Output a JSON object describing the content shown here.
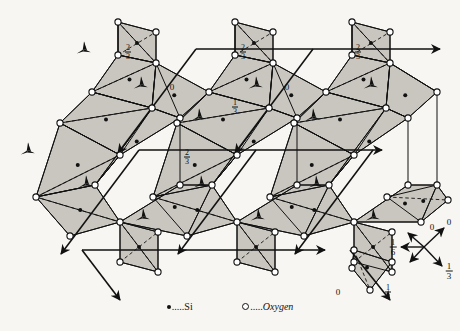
{
  "figure": {
    "background": "#f7f6f2",
    "tetra_fill": "#c9c6bf",
    "line_color": "#111111"
  },
  "legend": {
    "si_symbol": "si-dot",
    "si_leader": ".....",
    "si_label": "Si",
    "oxygen_symbol": "oxygen-circle",
    "oxygen_leader": ".....",
    "oxygen_label": "Oxygen"
  },
  "axis_key": {
    "up_right_label": "0",
    "left_label": "1/6",
    "left_num": "1",
    "left_den": "6",
    "down_right_label": "1/3",
    "down_right_num": "1",
    "down_right_den": "3"
  },
  "height_labels": [
    {
      "id": "h1",
      "text": "2/3",
      "num": "2",
      "den": "3",
      "x": 128,
      "y": 52
    },
    {
      "id": "h2",
      "text": "2/3",
      "num": "2",
      "den": "3",
      "x": 243,
      "y": 52
    },
    {
      "id": "h3",
      "text": "2/3",
      "num": "2",
      "den": "3",
      "x": 358,
      "y": 52
    },
    {
      "id": "h4",
      "text": "0",
      "num": "",
      "den": "",
      "x": 172,
      "y": 87
    },
    {
      "id": "h5",
      "text": "0",
      "num": "",
      "den": "",
      "x": 287,
      "y": 87
    },
    {
      "id": "h6",
      "text": "1/3",
      "num": "1",
      "den": "3",
      "x": 235,
      "y": 107
    },
    {
      "id": "h7",
      "text": "2/3",
      "num": "2",
      "den": "3",
      "x": 187,
      "y": 157
    },
    {
      "id": "h8",
      "text": "0",
      "num": "",
      "den": "",
      "x": 432,
      "y": 227
    },
    {
      "id": "h9",
      "text": "0",
      "num": "",
      "den": "",
      "x": 338,
      "y": 292
    },
    {
      "id": "h10",
      "text": "1/3",
      "num": "1",
      "den": "3",
      "x": 388,
      "y": 292
    }
  ],
  "triads": [
    {
      "x": 84,
      "y": 49,
      "rot": 0
    },
    {
      "x": 141,
      "y": 84,
      "rot": 0
    },
    {
      "x": 199,
      "y": 116,
      "rot": 0
    },
    {
      "x": 256,
      "y": 84,
      "rot": 0
    },
    {
      "x": 313,
      "y": 116,
      "rot": 0
    },
    {
      "x": 371,
      "y": 84,
      "rot": 0
    },
    {
      "x": 28,
      "y": 150,
      "rot": 0
    },
    {
      "x": 86,
      "y": 183,
      "rot": 0
    },
    {
      "x": 143,
      "y": 216,
      "rot": 0
    },
    {
      "x": 201,
      "y": 183,
      "rot": 0
    },
    {
      "x": 258,
      "y": 216,
      "rot": 0
    },
    {
      "x": 316,
      "y": 183,
      "rot": 0
    },
    {
      "x": 373,
      "y": 216,
      "rot": 0
    }
  ],
  "axis_arrows": [
    {
      "id": "a1",
      "x1": 196,
      "y1": 49,
      "x2": 440,
      "y2": 49
    },
    {
      "id": "a2",
      "x1": 139,
      "y1": 150,
      "x2": 382,
      "y2": 150
    },
    {
      "id": "a3",
      "x1": 82,
      "y1": 250,
      "x2": 325,
      "y2": 250
    }
  ],
  "diagonal_arrows": [
    {
      "id": "d1",
      "x1": 196,
      "y1": 49,
      "x2": 118,
      "y2": 153
    },
    {
      "id": "d2",
      "x1": 313,
      "y1": 49,
      "x2": 235,
      "y2": 153
    },
    {
      "id": "d3",
      "x1": 139,
      "y1": 150,
      "x2": 61,
      "y2": 254
    },
    {
      "id": "d4",
      "x1": 256,
      "y1": 150,
      "x2": 178,
      "y2": 254
    },
    {
      "id": "d5",
      "x1": 373,
      "y1": 150,
      "x2": 295,
      "y2": 254
    },
    {
      "id": "d6",
      "x1": 82,
      "y1": 250,
      "x2": 120,
      "y2": 300
    },
    {
      "id": "d7",
      "x1": 350,
      "y1": 250,
      "x2": 390,
      "y2": 300
    }
  ],
  "atoms": {
    "si_label": "Si",
    "oxygen_label": "Oxygen",
    "si_count": 18,
    "oxygen_count": 44
  },
  "chart_data": {
    "type": "diagram",
    "symbols": [
      "Si",
      "Oxygen"
    ],
    "heights": [
      "0",
      "1/6",
      "1/3",
      "2/3"
    ]
  }
}
